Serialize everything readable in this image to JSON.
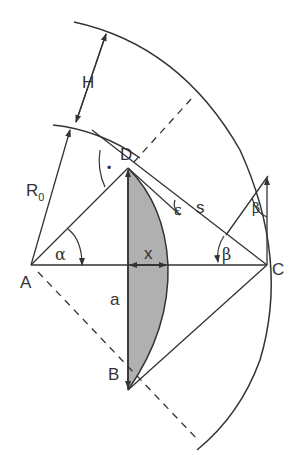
{
  "diagram": {
    "type": "geometry",
    "points": {
      "A": {
        "label": "A"
      },
      "B": {
        "label": "B"
      },
      "C": {
        "label": "C"
      },
      "D": {
        "label": "D"
      }
    },
    "labels": {
      "H": "H",
      "R0_main": "R",
      "R0_sub": "0",
      "s": "s",
      "a": "a",
      "x": "x",
      "alpha": "α",
      "beta1": "β",
      "beta2": "β",
      "epsilon": "ε",
      "right_angle_dot": "•"
    },
    "colors": {
      "stroke": "#333333",
      "fill_lens": "#b0b0b0",
      "background": "#ffffff"
    }
  }
}
